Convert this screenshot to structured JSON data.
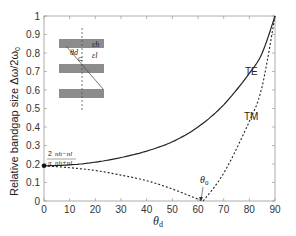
{
  "chart_data": {
    "type": "line",
    "title": "",
    "xlabel": "θd",
    "ylabel": "Relative bandgap size Δω/2ω0",
    "xlim": [
      0,
      90
    ],
    "ylim": [
      0,
      1
    ],
    "xticks": [
      0,
      10,
      20,
      30,
      40,
      50,
      60,
      70,
      80,
      90
    ],
    "yticks": [
      0,
      0.1,
      0.2,
      0.3,
      0.4,
      0.5,
      0.6,
      0.7,
      0.8,
      0.9,
      1
    ],
    "ytick_labels": [
      "0",
      "0.1",
      "0.2",
      "0.3",
      "0.4",
      "0.5",
      "0.6",
      "0.7",
      "0.8",
      "0.9",
      "1"
    ],
    "grid": false,
    "legend": "inline labels",
    "series": [
      {
        "name": "TE",
        "style": "solid",
        "x": [
          0,
          10,
          20,
          30,
          40,
          50,
          60,
          70,
          80,
          85,
          90
        ],
        "values": [
          0.19,
          0.195,
          0.21,
          0.235,
          0.27,
          0.32,
          0.4,
          0.52,
          0.69,
          0.8,
          1.0
        ]
      },
      {
        "name": "TM",
        "style": "dotted",
        "x": [
          0,
          10,
          20,
          30,
          40,
          50,
          60,
          62,
          70,
          80,
          85,
          90
        ],
        "values": [
          0.19,
          0.18,
          0.165,
          0.14,
          0.11,
          0.065,
          0.01,
          0.0,
          0.15,
          0.43,
          0.62,
          1.0
        ]
      }
    ],
    "annotations": [
      {
        "text": "θ0",
        "x": 62,
        "y": 0.0,
        "note": "arrow pointing to TM zero at Brewster-like angle"
      },
      {
        "text": "2 nh−nl / π nh+nl",
        "x": 0,
        "y": 0.19,
        "note": "value at θd=0, marked with dot"
      },
      {
        "text": "εh",
        "note": "inset: high-index layer"
      },
      {
        "text": "εl",
        "note": "inset: low-index layer"
      },
      {
        "text": "θd",
        "note": "inset: propagation angle"
      },
      {
        "text": "C",
        "note": "inset: point label"
      }
    ]
  },
  "labels": {
    "te": "TE",
    "tm": "TM",
    "theta0": "θ",
    "theta0_sub": "0",
    "xlabel_main": "θ",
    "xlabel_sub": "d",
    "ylabel": "Relative bandgap size Δω/2ω",
    "ylabel_sub": "0",
    "formula_num_2": "2",
    "formula_pi": "π",
    "formula_num": "nh−nl",
    "formula_den": "nh+nl",
    "inset_eh": "εh",
    "inset_el": "εl",
    "inset_theta": "θd",
    "inset_c": "C"
  },
  "colors": {
    "line": "#222222",
    "axis": "#999999",
    "layer": "#8c8c8c"
  }
}
